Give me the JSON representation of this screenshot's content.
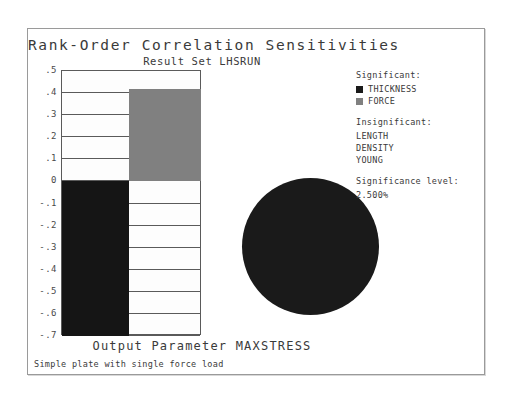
{
  "chart_data": {
    "type": "bar",
    "title": "Rank-Order Correlation Sensitivities",
    "subtitle": "Result Set LHSRUN",
    "xlabel": "Output Parameter MAXSTRESS",
    "ylabel": "",
    "ylim": [
      -0.7,
      0.5
    ],
    "grid": true,
    "categories": [
      "THICKNESS",
      "FORCE"
    ],
    "values": [
      -0.7,
      0.42
    ],
    "yticks": [
      ".5",
      ".4",
      ".3",
      ".2",
      ".1",
      "0",
      "-.1",
      "-.2",
      "-.3",
      "-.4",
      "-.5",
      "-.6",
      "-.7"
    ],
    "ytick_values": [
      0.5,
      0.4,
      0.3,
      0.2,
      0.1,
      0.0,
      -0.1,
      -0.2,
      -0.3,
      -0.4,
      -0.5,
      -0.6,
      -0.7
    ],
    "colors": [
      "#151515",
      "#808080"
    ],
    "legend_position": "right",
    "pie": {
      "type": "pie",
      "labels": [
        "THICKNESS",
        "FORCE"
      ],
      "values": [
        62.5,
        37.5
      ],
      "colors": [
        "#1a1a1a",
        "#808080"
      ],
      "start_angle_deg": 352
    }
  },
  "titles": {
    "main": "Rank-Order Correlation Sensitivities",
    "sub": "Result Set LHSRUN",
    "xaxis": "Output Parameter MAXSTRESS",
    "footer": "Simple plate with single force load"
  },
  "axis": {
    "ticks": [
      ".5",
      ".4",
      ".3",
      ".2",
      ".1",
      "0",
      "-.1",
      "-.2",
      "-.3",
      "-.4",
      "-.5",
      "-.6",
      "-.7"
    ]
  },
  "legend": {
    "significant_header": "Significant:",
    "significant": [
      {
        "label": "THICKNESS",
        "color": "#1a1a1a"
      },
      {
        "label": "FORCE",
        "color": "#808080"
      }
    ],
    "insignificant_header": "Insignificant:",
    "insignificant": [
      "LENGTH",
      "DENSITY",
      "YOUNG"
    ],
    "siglevel_header": "Significance level:",
    "siglevel_value": "2.500%"
  },
  "colors": {
    "dark": "#151515",
    "gray": "#808080",
    "frame": "#9a9a9a",
    "grid": "#5a5a5a",
    "text": "#3a3a3a"
  }
}
